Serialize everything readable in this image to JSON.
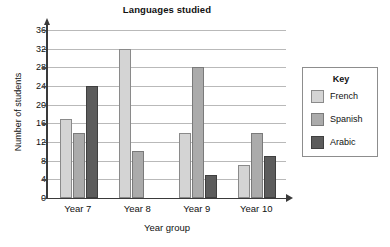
{
  "chart_data": {
    "type": "bar",
    "title": "Languages studied",
    "xlabel": "Year group",
    "ylabel": "Number of students",
    "categories": [
      "Year 7",
      "Year 8",
      "Year 9",
      "Year 10"
    ],
    "series": [
      {
        "name": "French",
        "color": "#d4d4d4",
        "values": [
          17,
          32,
          14,
          7
        ]
      },
      {
        "name": "Spanish",
        "color": "#ababab",
        "values": [
          14,
          10,
          28,
          14
        ]
      },
      {
        "name": "Arabic",
        "color": "#5c5c5c",
        "values": [
          24,
          0,
          5,
          9
        ]
      }
    ],
    "ylim": [
      0,
      36
    ],
    "ytick_step": 4,
    "yticks": [
      0,
      4,
      8,
      12,
      16,
      20,
      24,
      28,
      32,
      36
    ],
    "ytick_labels": [
      "0",
      "4",
      "8",
      "12",
      "16",
      "20",
      "24",
      "28",
      "32",
      "36"
    ],
    "grid": true,
    "grid_axis": "y",
    "legend_position": "right",
    "legend_title": "Key",
    "legend_entries": [
      "French",
      "Spanish",
      "Arabic"
    ]
  }
}
